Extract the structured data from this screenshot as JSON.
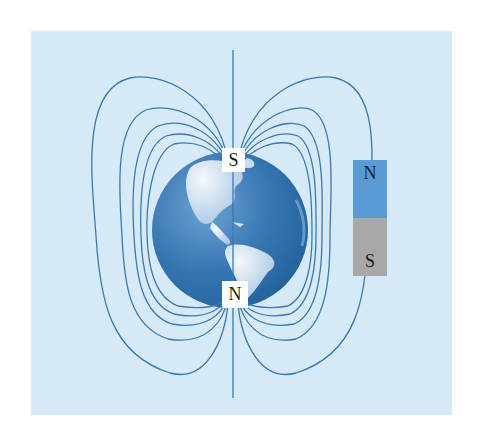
{
  "diagram": {
    "colors": {
      "background": "#d6e9f7",
      "field_line": "#3a78b5",
      "globe_ocean": "#2f6fab",
      "globe_land": "#dbe8f4",
      "magnet_north": "#5b9bd5",
      "magnet_south": "#a8a8a8",
      "label_box": "#ffffff"
    },
    "earth": {
      "top_pole_label": "S",
      "bottom_pole_label": "N"
    },
    "bar_magnet": {
      "north_label": "N",
      "south_label": "S"
    }
  }
}
